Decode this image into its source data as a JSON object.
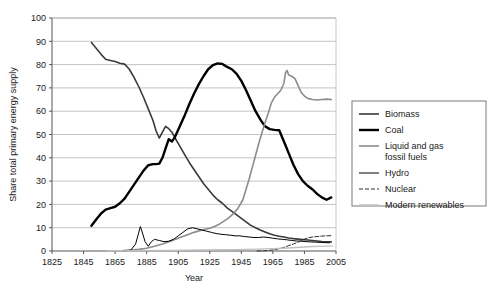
{
  "chart_data": {
    "type": "line",
    "title": "",
    "xlabel": "Year",
    "ylabel": "Share total primary energy supply",
    "xlim": [
      1825,
      2005
    ],
    "ylim": [
      0,
      100
    ],
    "xticks": [
      1825,
      1845,
      1865,
      1885,
      1905,
      1925,
      1945,
      1965,
      1985,
      2005
    ],
    "yticks": [
      0,
      10,
      20,
      30,
      40,
      50,
      60,
      70,
      80,
      90,
      100
    ],
    "grid": "horizontal",
    "legend_position": "right",
    "series": [
      {
        "name": "Biomass",
        "color": "#3a3a3a",
        "width": 1.6,
        "dash": "none",
        "points": [
          [
            1850,
            89.5
          ],
          [
            1853,
            87.0
          ],
          [
            1856,
            84.5
          ],
          [
            1859,
            82.3
          ],
          [
            1862,
            81.8
          ],
          [
            1865,
            81.3
          ],
          [
            1868,
            80.6
          ],
          [
            1871,
            80.2
          ],
          [
            1874,
            78.0
          ],
          [
            1877,
            74.5
          ],
          [
            1880,
            70.5
          ],
          [
            1883,
            66.0
          ],
          [
            1886,
            61.0
          ],
          [
            1889,
            56.0
          ],
          [
            1891,
            51.5
          ],
          [
            1893,
            48.5
          ],
          [
            1895,
            51.0
          ],
          [
            1897,
            53.5
          ],
          [
            1899,
            52.5
          ],
          [
            1901,
            51.0
          ],
          [
            1903,
            48.5
          ],
          [
            1906,
            45.0
          ],
          [
            1909,
            41.5
          ],
          [
            1912,
            38.0
          ],
          [
            1915,
            35.0
          ],
          [
            1918,
            32.0
          ],
          [
            1921,
            29.0
          ],
          [
            1924,
            26.5
          ],
          [
            1927,
            24.0
          ],
          [
            1930,
            22.0
          ],
          [
            1933,
            20.5
          ],
          [
            1936,
            18.5
          ],
          [
            1939,
            17.0
          ],
          [
            1942,
            15.5
          ],
          [
            1945,
            14.0
          ],
          [
            1948,
            12.5
          ],
          [
            1951,
            11.0
          ],
          [
            1954,
            10.0
          ],
          [
            1957,
            9.0
          ],
          [
            1960,
            8.2
          ],
          [
            1963,
            7.4
          ],
          [
            1966,
            6.8
          ],
          [
            1969,
            6.3
          ],
          [
            1972,
            6.0
          ],
          [
            1975,
            5.6
          ],
          [
            1978,
            5.3
          ],
          [
            1981,
            5.1
          ],
          [
            1984,
            4.9
          ],
          [
            1987,
            4.7
          ],
          [
            1990,
            4.5
          ],
          [
            1993,
            4.3
          ],
          [
            1996,
            4.1
          ],
          [
            1999,
            4.0
          ],
          [
            2002,
            3.9
          ]
        ]
      },
      {
        "name": "Coal",
        "color": "#000000",
        "width": 2.4,
        "dash": "none",
        "points": [
          [
            1850,
            10.8
          ],
          [
            1853,
            13.5
          ],
          [
            1856,
            16.0
          ],
          [
            1859,
            17.8
          ],
          [
            1862,
            18.4
          ],
          [
            1865,
            19.0
          ],
          [
            1868,
            20.5
          ],
          [
            1871,
            22.5
          ],
          [
            1874,
            25.5
          ],
          [
            1877,
            28.5
          ],
          [
            1880,
            31.5
          ],
          [
            1883,
            34.5
          ],
          [
            1886,
            36.8
          ],
          [
            1889,
            37.3
          ],
          [
            1891,
            37.3
          ],
          [
            1893,
            37.5
          ],
          [
            1895,
            40.0
          ],
          [
            1897,
            44.0
          ],
          [
            1899,
            48.0
          ],
          [
            1901,
            47.0
          ],
          [
            1903,
            49.0
          ],
          [
            1906,
            53.5
          ],
          [
            1909,
            58.0
          ],
          [
            1912,
            63.0
          ],
          [
            1915,
            67.5
          ],
          [
            1918,
            71.5
          ],
          [
            1921,
            75.0
          ],
          [
            1924,
            78.0
          ],
          [
            1927,
            79.8
          ],
          [
            1930,
            80.5
          ],
          [
            1933,
            80.3
          ],
          [
            1936,
            79.0
          ],
          [
            1939,
            78.0
          ],
          [
            1942,
            76.0
          ],
          [
            1945,
            73.0
          ],
          [
            1948,
            69.0
          ],
          [
            1951,
            64.5
          ],
          [
            1954,
            60.0
          ],
          [
            1957,
            56.5
          ],
          [
            1960,
            53.5
          ],
          [
            1963,
            52.3
          ],
          [
            1966,
            52.0
          ],
          [
            1969,
            51.8
          ],
          [
            1972,
            47.0
          ],
          [
            1975,
            42.0
          ],
          [
            1978,
            37.0
          ],
          [
            1981,
            33.0
          ],
          [
            1984,
            30.0
          ],
          [
            1987,
            28.0
          ],
          [
            1990,
            26.5
          ],
          [
            1993,
            24.5
          ],
          [
            1996,
            23.0
          ],
          [
            1999,
            22.0
          ],
          [
            2002,
            23.0
          ]
        ]
      },
      {
        "name": "Liquid and gas fossil fuels",
        "color": "#8c8c8c",
        "width": 1.6,
        "dash": "none",
        "points": [
          [
            1870,
            0.2
          ],
          [
            1875,
            0.4
          ],
          [
            1880,
            0.7
          ],
          [
            1885,
            1.2
          ],
          [
            1890,
            2.0
          ],
          [
            1895,
            3.0
          ],
          [
            1900,
            4.2
          ],
          [
            1905,
            5.5
          ],
          [
            1910,
            6.8
          ],
          [
            1915,
            8.0
          ],
          [
            1920,
            9.0
          ],
          [
            1925,
            9.8
          ],
          [
            1928,
            10.5
          ],
          [
            1931,
            11.5
          ],
          [
            1934,
            12.8
          ],
          [
            1937,
            14.2
          ],
          [
            1940,
            16.0
          ],
          [
            1943,
            18.5
          ],
          [
            1946,
            22.0
          ],
          [
            1948,
            26.5
          ],
          [
            1950,
            31.0
          ],
          [
            1952,
            36.0
          ],
          [
            1954,
            41.0
          ],
          [
            1956,
            46.0
          ],
          [
            1958,
            50.5
          ],
          [
            1960,
            55.0
          ],
          [
            1962,
            59.0
          ],
          [
            1964,
            63.5
          ],
          [
            1966,
            66.0
          ],
          [
            1968,
            67.5
          ],
          [
            1970,
            69.0
          ],
          [
            1972,
            72.0
          ],
          [
            1973,
            76.5
          ],
          [
            1974,
            77.5
          ],
          [
            1975,
            75.5
          ],
          [
            1977,
            75.0
          ],
          [
            1979,
            74.0
          ],
          [
            1981,
            71.0
          ],
          [
            1983,
            68.0
          ],
          [
            1985,
            66.5
          ],
          [
            1987,
            65.5
          ],
          [
            1990,
            65.0
          ],
          [
            1993,
            64.8
          ],
          [
            1996,
            65.0
          ],
          [
            1999,
            65.2
          ],
          [
            2002,
            65.0
          ]
        ]
      },
      {
        "name": "Hydro",
        "color": "#000000",
        "width": 1.0,
        "dash": "none",
        "points": [
          [
            1870,
            0.1
          ],
          [
            1875,
            0.4
          ],
          [
            1878,
            3.0
          ],
          [
            1880,
            8.0
          ],
          [
            1881,
            10.5
          ],
          [
            1882,
            8.5
          ],
          [
            1884,
            4.0
          ],
          [
            1886,
            2.0
          ],
          [
            1888,
            4.0
          ],
          [
            1890,
            5.0
          ],
          [
            1893,
            4.5
          ],
          [
            1896,
            4.0
          ],
          [
            1899,
            4.2
          ],
          [
            1902,
            5.0
          ],
          [
            1905,
            6.5
          ],
          [
            1908,
            8.0
          ],
          [
            1911,
            9.5
          ],
          [
            1914,
            10.0
          ],
          [
            1917,
            9.5
          ],
          [
            1920,
            9.0
          ],
          [
            1923,
            8.5
          ],
          [
            1926,
            8.0
          ],
          [
            1929,
            7.5
          ],
          [
            1932,
            7.2
          ],
          [
            1935,
            7.0
          ],
          [
            1938,
            6.8
          ],
          [
            1941,
            6.5
          ],
          [
            1944,
            6.5
          ],
          [
            1947,
            6.2
          ],
          [
            1950,
            6.0
          ],
          [
            1953,
            5.8
          ],
          [
            1956,
            5.8
          ],
          [
            1959,
            6.0
          ],
          [
            1962,
            5.8
          ],
          [
            1965,
            5.5
          ],
          [
            1968,
            5.2
          ],
          [
            1971,
            5.0
          ],
          [
            1974,
            4.8
          ],
          [
            1977,
            4.5
          ],
          [
            1980,
            4.3
          ],
          [
            1983,
            4.2
          ],
          [
            1986,
            4.0
          ],
          [
            1989,
            3.9
          ],
          [
            1992,
            3.8
          ],
          [
            1995,
            3.7
          ],
          [
            1998,
            3.6
          ],
          [
            2001,
            3.5
          ]
        ]
      },
      {
        "name": "Nuclear",
        "color": "#2a2a2a",
        "width": 1.0,
        "dash": "4 2",
        "points": [
          [
            1955,
            0.0
          ],
          [
            1960,
            0.1
          ],
          [
            1963,
            0.3
          ],
          [
            1966,
            0.6
          ],
          [
            1969,
            1.0
          ],
          [
            1972,
            1.5
          ],
          [
            1975,
            2.3
          ],
          [
            1978,
            3.0
          ],
          [
            1981,
            3.8
          ],
          [
            1984,
            4.8
          ],
          [
            1987,
            5.6
          ],
          [
            1990,
            6.0
          ],
          [
            1993,
            6.2
          ],
          [
            1996,
            6.4
          ],
          [
            1999,
            6.5
          ],
          [
            2002,
            6.6
          ]
        ]
      },
      {
        "name": "Modern renewables",
        "color": "#c0c0c0",
        "width": 1.4,
        "dash": "none",
        "points": [
          [
            1860,
            0.05
          ],
          [
            1880,
            0.1
          ],
          [
            1900,
            0.2
          ],
          [
            1920,
            0.4
          ],
          [
            1940,
            0.6
          ],
          [
            1955,
            0.8
          ],
          [
            1965,
            1.0
          ],
          [
            1972,
            1.2
          ],
          [
            1980,
            1.5
          ],
          [
            1985,
            1.7
          ],
          [
            1990,
            1.9
          ],
          [
            1995,
            2.0
          ],
          [
            2000,
            2.1
          ],
          [
            2003,
            2.2
          ]
        ]
      }
    ]
  },
  "legend": {
    "items": [
      {
        "label": "Biomass",
        "swatch": "biomass-swatch"
      },
      {
        "label": "Coal",
        "swatch": "coal-swatch"
      },
      {
        "label": "Liquid and gas",
        "label2": "fossil fuels",
        "swatch": "liquid-gas-swatch"
      },
      {
        "label": "Hydro",
        "swatch": "hydro-swatch"
      },
      {
        "label": "Nuclear",
        "swatch": "nuclear-swatch"
      },
      {
        "label": "Modern renewables",
        "swatch": "modern-renewables-swatch"
      }
    ]
  }
}
